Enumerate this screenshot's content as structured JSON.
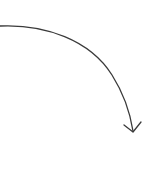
{
  "diagram": {
    "elements": [
      {
        "type": "curved-arrow",
        "from": [
          0,
          26
        ],
        "to": [
          133,
          132
        ],
        "direction": "clockwise-down-right"
      }
    ],
    "colors": {
      "stroke": "#3a3a3a",
      "background": "#ffffff"
    }
  }
}
